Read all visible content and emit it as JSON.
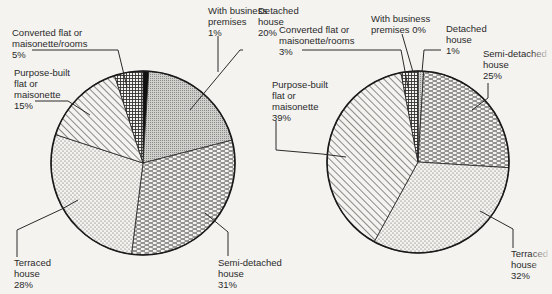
{
  "chart_data": [
    {
      "type": "pie",
      "title": "",
      "categories": [
        "With business premises",
        "Detached house",
        "Semi-detached house",
        "Terraced house",
        "Purpose-built flat or maisonette",
        "Converted flat or maisonette/rooms"
      ],
      "values": [
        1,
        20,
        31,
        28,
        15,
        5
      ],
      "unit": "%",
      "start": "top, clockwise",
      "labels": [
        {
          "lines": [
            "With business",
            "premises",
            "1%"
          ]
        },
        {
          "lines": [
            "Detached",
            "house",
            "20%"
          ]
        },
        {
          "lines": [
            "Semi-detached",
            "house",
            "31%"
          ]
        },
        {
          "lines": [
            "Terraced",
            "house",
            "28%"
          ]
        },
        {
          "lines": [
            "Purpose-built",
            "flat or",
            "maisonette",
            "15%"
          ]
        },
        {
          "lines": [
            "Converted flat or",
            "maisonette/rooms",
            "5%"
          ]
        }
      ],
      "patterns": [
        "solid-black",
        "fine-dots-grey",
        "dashes",
        "dots",
        "diagonal-hatch",
        "crosshatch"
      ]
    },
    {
      "type": "pie",
      "title": "",
      "categories": [
        "With business premises",
        "Detached house",
        "Semi-detached house",
        "Terraced house",
        "Purpose-built flat or maisonette",
        "Converted flat or maisonette/rooms"
      ],
      "values": [
        0,
        1,
        25,
        32,
        39,
        3
      ],
      "unit": "%",
      "start": "top, clockwise",
      "labels": [
        {
          "lines": [
            "With business",
            "premises  0%"
          ]
        },
        {
          "lines": [
            "Detached",
            "house",
            "1%"
          ]
        },
        {
          "lines": [
            "Semi-detached",
            "house",
            "25%"
          ]
        },
        {
          "lines": [
            "Terraced",
            "house",
            "32%"
          ]
        },
        {
          "lines": [
            "Purpose-built",
            "flat or",
            "maisonette",
            "39%"
          ]
        },
        {
          "lines": [
            "Converted flat or",
            "maisonette/rooms",
            "3%"
          ]
        }
      ],
      "patterns": [
        "solid-black",
        "fine-dots-grey",
        "dashes",
        "dots",
        "diagonal-hatch",
        "crosshatch"
      ]
    }
  ]
}
